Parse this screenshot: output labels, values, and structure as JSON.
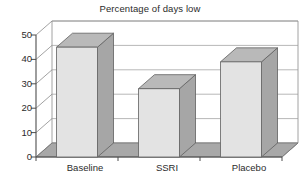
{
  "chart_data": {
    "type": "bar",
    "title": "Percentage of days low",
    "xlabel": "",
    "ylabel": "",
    "categories": [
      "Baseline",
      "SSRI",
      "Placebo"
    ],
    "values": [
      45,
      28,
      39
    ],
    "ylim": [
      0,
      50
    ],
    "yticks": [
      0,
      10,
      20,
      30,
      40,
      50
    ],
    "ytick_labels": [
      "0",
      "10",
      "20",
      "30",
      "40",
      "50"
    ],
    "grid": true,
    "legend": null,
    "style": {
      "three_d": true,
      "bar_front_color": "#e3e3e3",
      "bar_top_color": "#b9b9b9",
      "bar_side_color": "#a6a6a6",
      "floor_color": "#a8a8a8",
      "plot_background": "#ffffff",
      "axis_color": "#4d4d4d",
      "grid_color": "#9a9a9a",
      "text_color": "#2b2b2b"
    }
  }
}
